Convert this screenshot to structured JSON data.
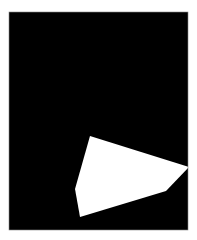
{
  "image": {
    "description": "Black rectangular field with a white irregular polygon in the lower right",
    "background_color": "#ffffff",
    "field_color": "#000000",
    "shape_color": "#ffffff",
    "shape_vertex_count": 6,
    "shape_kind": "irregular hexagon"
  }
}
